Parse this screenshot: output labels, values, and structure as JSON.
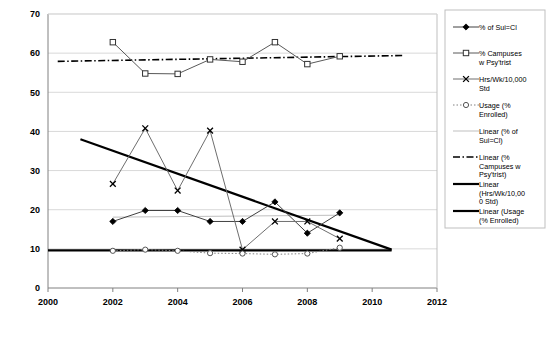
{
  "chart_data": {
    "type": "line",
    "title": "",
    "xlabel": "",
    "ylabel": "",
    "xlim": [
      2000,
      2012
    ],
    "ylim": [
      0,
      70
    ],
    "xticks": [
      "2000",
      "2002",
      "2004",
      "2006",
      "2008",
      "2010",
      "2012"
    ],
    "yticks": [
      "0",
      "10",
      "20",
      "30",
      "40",
      "50",
      "60",
      "70"
    ],
    "grid": true,
    "legend_position": "right",
    "x": [
      2002,
      2003,
      2004,
      2005,
      2006,
      2007,
      2008,
      2009
    ],
    "series": [
      {
        "name": "% of Sui=Cl",
        "marker": "filled-diamond",
        "line": "solid",
        "color": "#404040",
        "values": [
          17.0,
          19.8,
          19.8,
          17.0,
          17.0,
          22.0,
          14.0,
          19.2
        ]
      },
      {
        "name": "% Campuses w Psy'trist",
        "marker": "open-square",
        "line": "solid",
        "color": "#595959",
        "values": [
          62.8,
          54.8,
          54.7,
          58.4,
          57.8,
          62.8,
          57.2,
          59.2
        ]
      },
      {
        "name": "Hrs/Wk/10,000 Std",
        "marker": "x-cross",
        "line": "solid",
        "color": "#6e6e6e",
        "values": [
          26.6,
          40.8,
          24.9,
          40.2,
          9.8,
          17.0,
          17.0,
          12.6
        ]
      },
      {
        "name": "Usage (% Enrolled)",
        "marker": "open-circle",
        "line": "dotted",
        "color": "#808080",
        "values": [
          9.5,
          9.8,
          9.5,
          8.9,
          8.8,
          8.6,
          8.8,
          10.3
        ]
      }
    ],
    "trendlines": [
      {
        "name": "Linear (% of Sui=Cl)",
        "line": "solid-thin",
        "color": "#bfbfbf",
        "x": [
          2002,
          2009
        ],
        "y": [
          18.1,
          18.6
        ]
      },
      {
        "name": "Linear (% Campuses w Psy'trist)",
        "line": "dash-dot",
        "color": "#000000",
        "x": [
          2000.3,
          2011.0
        ],
        "y": [
          57.9,
          59.4
        ]
      },
      {
        "name": "Linear (Hrs/Wk/10,000 Std)",
        "line": "solid-thick",
        "color": "#000000",
        "x": [
          2001.0,
          2010.6
        ],
        "y": [
          38.0,
          9.8
        ]
      },
      {
        "name": "Linear (Usage (% Enrolled))",
        "line": "solid-thick",
        "color": "#000000",
        "x": [
          2000.0,
          2010.6
        ],
        "y": [
          9.6,
          9.6
        ]
      }
    ]
  },
  "legend": {
    "items": [
      {
        "label_line1": "% of Sui=Cl",
        "label_line2": "",
        "key": "sui-cl"
      },
      {
        "label_line1": "% Campuses",
        "label_line2": "w Psy'trist",
        "key": "campuses"
      },
      {
        "label_line1": "Hrs/Wk/10,000",
        "label_line2": "Std",
        "key": "hrs-wk"
      },
      {
        "label_line1": "Usage (%",
        "label_line2": "Enrolled)",
        "key": "usage"
      },
      {
        "label_line1": "Linear (% of",
        "label_line2": "Sui=Cl)",
        "key": "lin-sui-cl"
      },
      {
        "label_line1": "Linear (%",
        "label_line2": "Campuses w",
        "label_line3": "Psy'trist)",
        "key": "lin-campuses"
      },
      {
        "label_line1": "Linear",
        "label_line2": "(Hrs/Wk/10,00",
        "label_line3": "0 Std)",
        "key": "lin-hrs-wk"
      },
      {
        "label_line1": "Linear (Usage",
        "label_line2": "(% Enrolled)",
        "key": "lin-usage"
      }
    ]
  }
}
